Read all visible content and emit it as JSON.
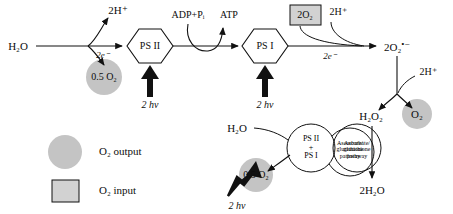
{
  "diagram": {
    "title_text": "",
    "colors": {
      "grey_fill": "#c4c4c4",
      "box_fill": "#d2d2d2",
      "stroke": "#111111",
      "background": "#ffffff"
    },
    "upper_pathway": {
      "water_source": "H₂O",
      "protons_released": "2H⁺",
      "electron_label": "2e⁻",
      "oxygen_evolved": "0.5 O₂",
      "photosystem_two": "PS II",
      "light_ps2": "2 hν",
      "adp_pi": "ADP+Pᵢ",
      "atp": "ATP",
      "photosystem_one": "PS I",
      "light_ps1": "2 hν",
      "oxygen_input": "2O₂",
      "protons_uptake": "2H⁺",
      "electron_label_2": "2e⁻",
      "superoxide": "2O₂",
      "superoxide_charge": "•−",
      "protons_uptake_2": "2H⁺",
      "hydrogen_peroxide": "H₂O₂",
      "oxygen_output": "O₂",
      "water_product": "2H₂O",
      "detox_pathway_line1": "Ascorbate/",
      "detox_pathway_line2": "glutathione",
      "detox_pathway_line3": "pathway"
    },
    "lower_pathway": {
      "water_source": "H₂O",
      "combined_photosystems_line1": "PS II",
      "combined_photosystems_line2": "+",
      "combined_photosystems_line3": "PS I",
      "oxygen_evolved": "0.5 O₂",
      "light_input": "2 hν"
    },
    "legend": {
      "output_label": "O₂ output",
      "input_label": "O₂ input"
    }
  }
}
